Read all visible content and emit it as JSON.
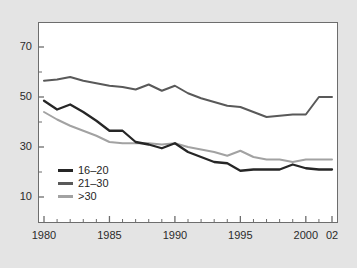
{
  "chart_data": {
    "type": "line",
    "title": "",
    "xlabel": "",
    "ylabel": "",
    "xlim": [
      1980,
      2002
    ],
    "ylim": [
      4,
      78
    ],
    "grid": false,
    "legend_position": "lower-left-inside",
    "x": [
      1980,
      1981,
      1982,
      1983,
      1984,
      1985,
      1986,
      1987,
      1988,
      1989,
      1990,
      1991,
      1992,
      1993,
      1994,
      1995,
      1996,
      1997,
      1998,
      1999,
      2000,
      2001,
      2002
    ],
    "x_tick_labels": [
      "1980",
      "1985",
      "1990",
      "1995",
      "2000",
      "02"
    ],
    "x_tick_values": [
      1980,
      1985,
      1990,
      1995,
      2000,
      2002
    ],
    "y_tick_labels": [
      "70",
      "50",
      "30",
      "10"
    ],
    "y_tick_values": [
      70,
      50,
      30,
      10
    ],
    "y_minor_tick_values": [
      20,
      40,
      60
    ],
    "series": [
      {
        "name": "16–20",
        "color": "#262626",
        "values": [
          48.5,
          45.0,
          47.0,
          44.0,
          40.5,
          36.5,
          36.5,
          32.0,
          31.0,
          29.5,
          31.5,
          28.0,
          26.0,
          24.0,
          23.5,
          20.5,
          21.0,
          21.0,
          21.0,
          23.0,
          21.5,
          21.0,
          21.0
        ]
      },
      {
        "name": "21–30",
        "color": "#595959",
        "values": [
          56.5,
          57.0,
          58.0,
          56.5,
          55.5,
          54.5,
          54.0,
          53.0,
          55.0,
          52.5,
          54.5,
          51.5,
          49.5,
          48.0,
          46.5,
          46.0,
          44.0,
          42.0,
          42.5,
          43.0,
          43.0,
          50.0,
          50.0
        ]
      },
      {
        "name": ">30",
        "color": "#a2a2a2",
        "values": [
          44.0,
          41.0,
          38.5,
          36.5,
          34.5,
          32.0,
          31.5,
          31.5,
          31.5,
          31.0,
          31.5,
          30.0,
          29.0,
          28.0,
          26.5,
          28.5,
          26.0,
          25.0,
          25.0,
          24.0,
          25.0,
          25.0,
          25.0
        ]
      }
    ]
  },
  "axes": {
    "y_labels": [
      {
        "text": "70",
        "value": 70
      },
      {
        "text": "50",
        "value": 50
      },
      {
        "text": "30",
        "value": 30
      },
      {
        "text": "10",
        "value": 10
      }
    ],
    "x_labels": [
      {
        "text": "1980",
        "value": 1980
      },
      {
        "text": "1985",
        "value": 1985
      },
      {
        "text": "1990",
        "value": 1990
      },
      {
        "text": "1995",
        "value": 1995
      },
      {
        "text": "2000",
        "value": 2000
      },
      {
        "text": "02",
        "value": 2002
      }
    ]
  },
  "legend": {
    "entries": [
      {
        "label": "16–20",
        "color": "#262626"
      },
      {
        "label": "21–30",
        "color": "#595959"
      },
      {
        "label": ">30",
        "color": "#a2a2a2"
      }
    ]
  },
  "colors": {
    "page_background": "#e4e4e4",
    "panel_background": "#ffffff",
    "axis_line": "#6d6d6d",
    "tick_text": "#2b2b2b"
  }
}
